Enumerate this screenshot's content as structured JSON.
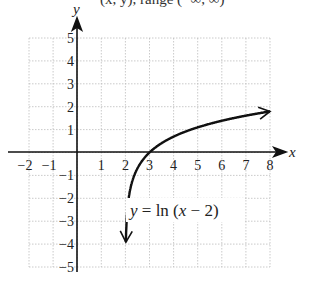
{
  "chart_data": {
    "type": "line",
    "title": "",
    "xlabel": "x",
    "ylabel": "y",
    "xlim": [
      -2,
      8
    ],
    "ylim": [
      -5,
      5
    ],
    "grid": true,
    "x_ticks": [
      "-2",
      "-1",
      "1",
      "2",
      "3",
      "4",
      "5",
      "6",
      "7",
      "8"
    ],
    "y_ticks": [
      "5",
      "4",
      "3",
      "2",
      "1",
      "-1",
      "-2",
      "-3",
      "-4",
      "-5"
    ],
    "series": [
      {
        "name": "y = ln (x - 2)",
        "function": "ln(x-2)",
        "x": [
          2.02,
          2.05,
          2.1,
          2.2,
          2.5,
          3,
          4,
          5,
          6,
          7,
          8
        ],
        "y": [
          -3.91,
          -3.0,
          -2.3,
          -1.61,
          -0.69,
          0,
          0.69,
          1.1,
          1.39,
          1.61,
          1.79
        ],
        "arrows": "both ends",
        "asymptote": "x = 2"
      }
    ],
    "annotations": [
      {
        "text": "y = ln (x − 2)",
        "x": 2.5,
        "y": -2.6
      }
    ]
  },
  "labels": {
    "x_axis": "x",
    "y_axis": "y",
    "equation_y": "y",
    "equation_eq": " = ln (",
    "equation_x": "x",
    "equation_rest": " − 2)",
    "top_partial": "(x, y), range (−∞, ∞)"
  },
  "ticks": {
    "x": [
      "−2",
      "−1",
      "1",
      "2",
      "3",
      "4",
      "5",
      "6",
      "7",
      "8"
    ],
    "y_pos": [
      "5",
      "4",
      "3",
      "2",
      "1"
    ],
    "y_neg": [
      "−1",
      "−2",
      "−3",
      "−4",
      "−5"
    ]
  }
}
